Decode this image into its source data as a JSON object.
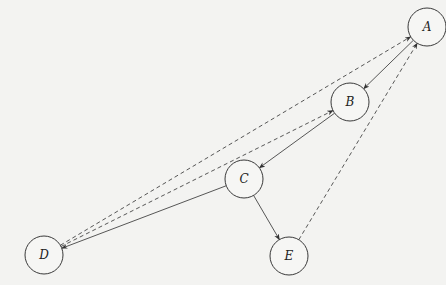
{
  "diagram": {
    "type": "directed-graph",
    "nodes": [
      {
        "id": "A",
        "label": "A",
        "x": 427,
        "y": 27,
        "r": 19
      },
      {
        "id": "B",
        "label": "B",
        "x": 350,
        "y": 102,
        "r": 19
      },
      {
        "id": "C",
        "label": "C",
        "x": 244,
        "y": 179,
        "r": 19
      },
      {
        "id": "D",
        "label": "D",
        "x": 44,
        "y": 255,
        "r": 19
      },
      {
        "id": "E",
        "label": "E",
        "x": 289,
        "y": 256,
        "r": 19
      }
    ],
    "edges": [
      {
        "from": "A",
        "to": "B",
        "style": "solid"
      },
      {
        "from": "B",
        "to": "C",
        "style": "solid"
      },
      {
        "from": "C",
        "to": "D",
        "style": "solid"
      },
      {
        "from": "C",
        "to": "E",
        "style": "solid"
      },
      {
        "from": "D",
        "to": "A",
        "style": "dashed"
      },
      {
        "from": "D",
        "to": "B",
        "style": "dashed"
      },
      {
        "from": "E",
        "to": "A",
        "style": "dashed"
      }
    ]
  }
}
